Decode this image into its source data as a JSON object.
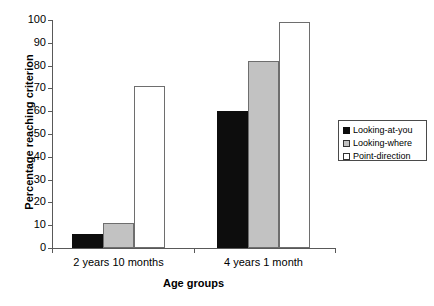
{
  "chart_data": {
    "type": "bar",
    "title": "",
    "subtitle": "",
    "xlabel": "Age groups",
    "ylabel": "Percentage reaching criterion",
    "categories": [
      "2 years 10 months",
      "4 years 1 month"
    ],
    "series": [
      {
        "name": "Looking-at-you",
        "values": [
          6,
          60
        ],
        "color": "#0d0d0d"
      },
      {
        "name": "Looking-where",
        "values": [
          11,
          82
        ],
        "color": "#c2c2c2"
      },
      {
        "name": "Point-direction",
        "values": [
          71,
          99
        ],
        "color": "#ffffff"
      }
    ],
    "ylim": [
      0,
      100
    ],
    "yticks": [
      0,
      10,
      20,
      30,
      40,
      50,
      60,
      70,
      80,
      90,
      100
    ],
    "ytick_labels": [
      "0",
      "10",
      "20",
      "30",
      "40",
      "50",
      "60",
      "70",
      "80",
      "90",
      "100"
    ],
    "grid": false,
    "legend_position": "right",
    "legend_entries": [
      "Looking-at-you",
      "Looking-where",
      "Point-direction"
    ]
  },
  "caption": {
    "text": ""
  }
}
